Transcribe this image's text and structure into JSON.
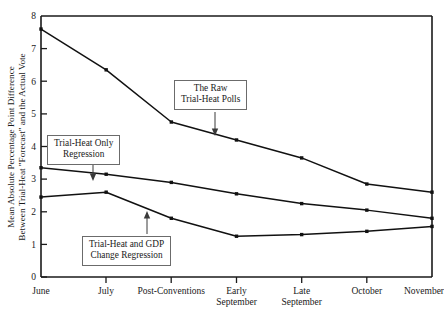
{
  "chart_data": {
    "type": "line",
    "title": "",
    "xlabel": "",
    "ylabel": "Mean Absolute Percentage Point Difference Between Trial-Heat \"Forecast\" and the Actual Vote",
    "categories": [
      "June",
      "July",
      "Post-Conventions",
      "Early September",
      "Late September",
      "October",
      "November"
    ],
    "ylim": [
      0,
      8
    ],
    "yticks": [
      0,
      1,
      2,
      3,
      4,
      5,
      6,
      7,
      8
    ],
    "grid": false,
    "legend_position": "inline-annotations",
    "series": [
      {
        "name": "The Raw Trial-Heat Polls",
        "values": [
          7.6,
          6.35,
          4.75,
          4.2,
          3.65,
          2.85,
          2.6
        ]
      },
      {
        "name": "Trial-Heat Only Regression",
        "values": [
          3.35,
          3.15,
          2.9,
          2.55,
          2.25,
          2.05,
          1.8
        ]
      },
      {
        "name": "Trial-Heat and GDP Change Regression",
        "values": [
          2.45,
          2.6,
          1.8,
          1.25,
          1.3,
          1.4,
          1.55
        ]
      }
    ],
    "annotations": [
      {
        "id": "raw-polls",
        "line1": "The Raw",
        "line2": "Trial-Heat Polls",
        "points_to": "series-0"
      },
      {
        "id": "trial-heat-only",
        "line1": "Trial-Heat Only",
        "line2": "Regression",
        "points_to": "series-1"
      },
      {
        "id": "trial-heat-gdp",
        "line1": "Trial-Heat and GDP",
        "line2": "Change Regression",
        "points_to": "series-2"
      }
    ]
  },
  "axis": {
    "y_label_line1": "Mean Absolute Percentage Point Difference",
    "y_label_line2": "Between Trial-Heat \"Forecast\" and the Actual Vote",
    "y_ticks": [
      "0",
      "1",
      "2",
      "3",
      "4",
      "5",
      "6",
      "7",
      "8"
    ],
    "x_ticks": [
      {
        "line1": "June",
        "line2": ""
      },
      {
        "line1": "July",
        "line2": ""
      },
      {
        "line1": "Post-Conventions",
        "line2": ""
      },
      {
        "line1": "Early",
        "line2": "September"
      },
      {
        "line1": "Late",
        "line2": "September"
      },
      {
        "line1": "October",
        "line2": ""
      },
      {
        "line1": "November",
        "line2": ""
      }
    ]
  },
  "colors": {
    "line": "#111111",
    "axis": "#1a1a1a",
    "box_border": "#6b6b6b",
    "background": "#ffffff"
  }
}
